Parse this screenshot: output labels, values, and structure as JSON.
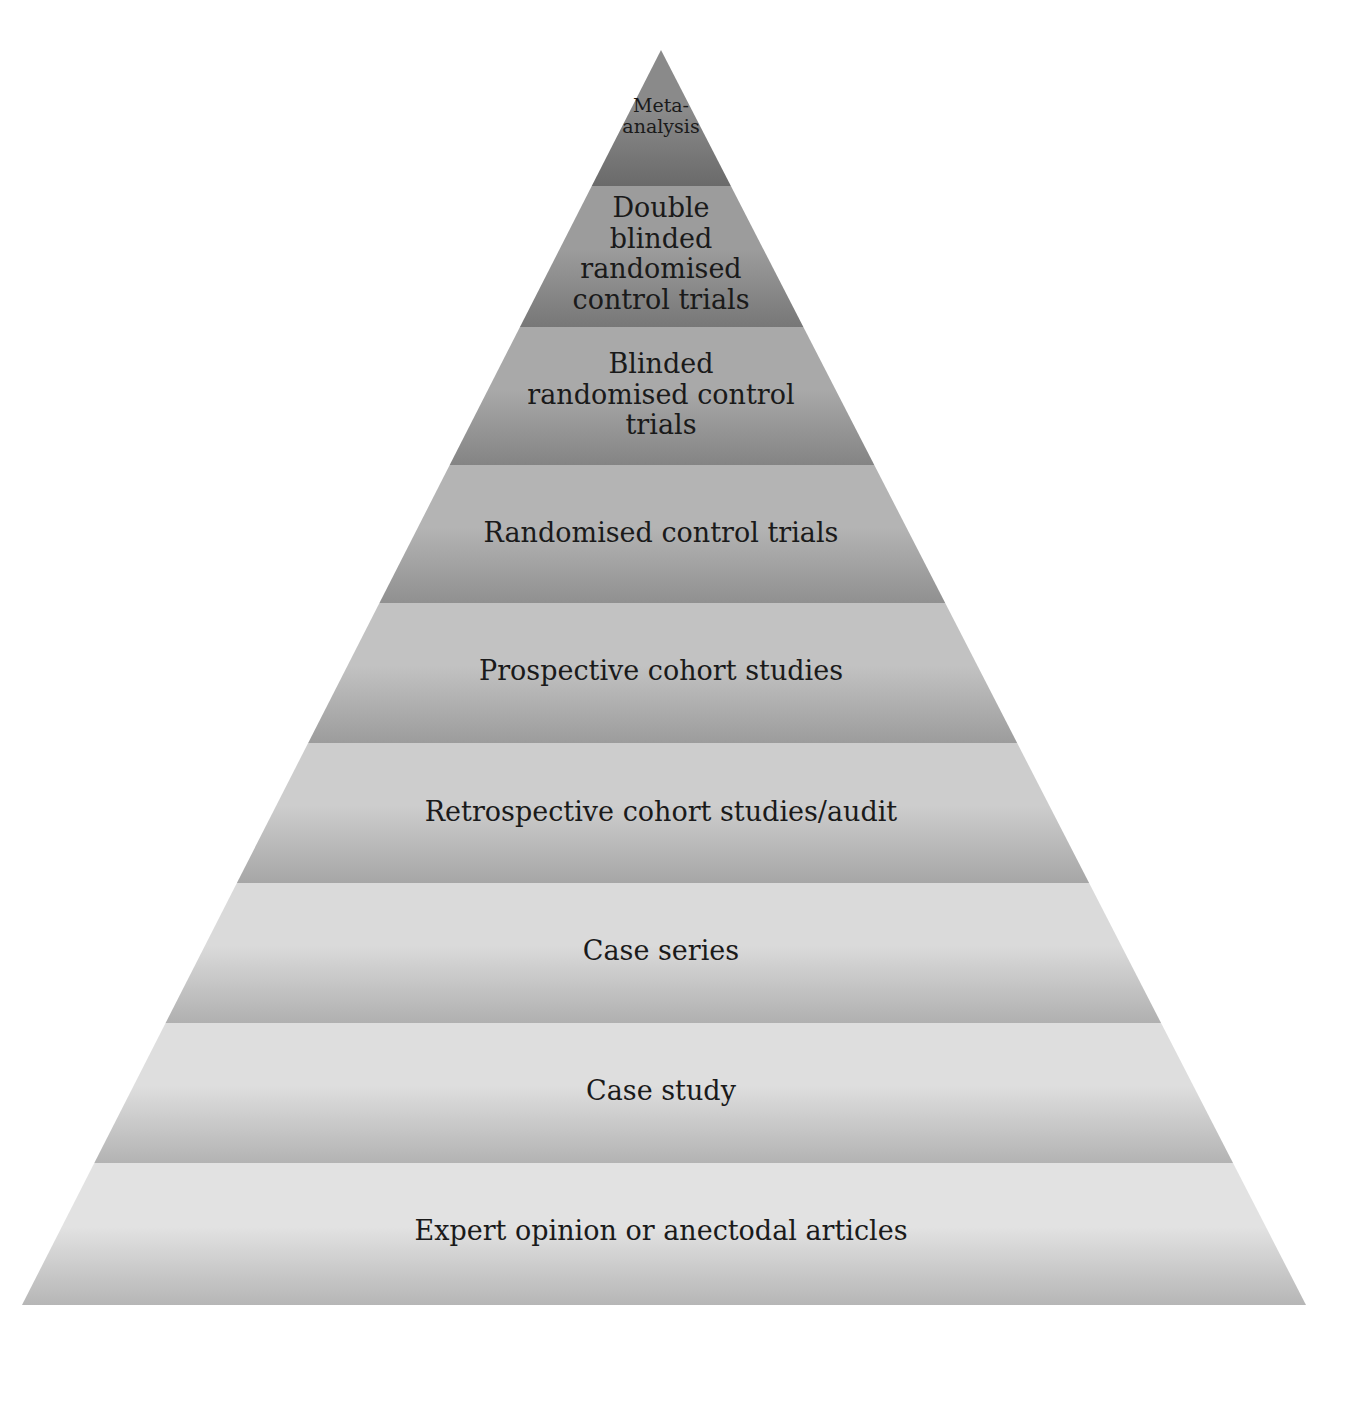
{
  "diagram": {
    "type": "pyramid",
    "title": "",
    "levels": [
      {
        "label": "Meta-\nanalysis",
        "lines": [
          "Meta-",
          "analysis"
        ],
        "top": 50,
        "bottom": 186,
        "fill_top": "#8a8a8a",
        "fill_bottom": "#6a6a6a",
        "font_size": 19,
        "text_y": 95
      },
      {
        "label": "Double blinded randomised control trials",
        "lines": [
          "Double",
          "blinded",
          "randomised",
          "control trials"
        ],
        "top": 186,
        "bottom": 327,
        "fill_top": "#9c9c9c",
        "fill_bottom": "#777777",
        "font_size": 27,
        "text_y": 193
      },
      {
        "label": "Blinded randomised control trials",
        "lines": [
          "Blinded",
          "randomised control",
          "trials"
        ],
        "top": 327,
        "bottom": 465,
        "fill_top": "#a9a9a9",
        "fill_bottom": "#848484",
        "font_size": 27,
        "text_y": 349
      },
      {
        "label": "Randomised control trials",
        "lines": [
          "Randomised control trials"
        ],
        "top": 465,
        "bottom": 603,
        "fill_top": "#b4b4b4",
        "fill_bottom": "#909090",
        "font_size": 27,
        "text_y": 518
      },
      {
        "label": "Prospective cohort studies",
        "lines": [
          "Prospective cohort studies"
        ],
        "top": 603,
        "bottom": 743,
        "fill_top": "#c2c2c2",
        "fill_bottom": "#9c9c9c",
        "font_size": 27,
        "text_y": 656
      },
      {
        "label": "Retrospective cohort studies/audit",
        "lines": [
          "Retrospective cohort studies/audit"
        ],
        "top": 743,
        "bottom": 883,
        "fill_top": "#cdcdcd",
        "fill_bottom": "#a6a6a6",
        "font_size": 27,
        "text_y": 797
      },
      {
        "label": "Case series",
        "lines": [
          "Case series"
        ],
        "top": 883,
        "bottom": 1023,
        "fill_top": "#dadada",
        "fill_bottom": "#b0b0b0",
        "font_size": 27,
        "text_y": 936
      },
      {
        "label": "Case study",
        "lines": [
          "Case study"
        ],
        "top": 1023,
        "bottom": 1163,
        "fill_top": "#dedede",
        "fill_bottom": "#b3b3b3",
        "font_size": 27,
        "text_y": 1076
      },
      {
        "label": "Expert opinion or anectodal articles",
        "lines": [
          "Expert opinion or anectodal articles"
        ],
        "top": 1163,
        "bottom": 1305,
        "fill_top": "#e2e2e2",
        "fill_bottom": "#b6b6b6",
        "font_size": 27,
        "text_y": 1216
      }
    ],
    "geometry": {
      "apex_x": 661,
      "apex_y": 50,
      "base_left_x": 22,
      "base_right_x": 1306,
      "base_y": 1305
    }
  }
}
